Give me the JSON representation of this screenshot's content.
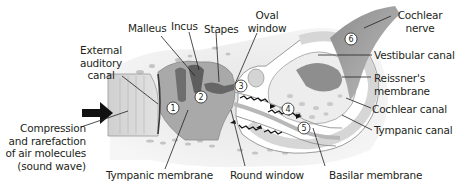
{
  "diagram": {
    "labels": {
      "malleus": "Malleus",
      "incus": "Incus",
      "stapes": "Stapes",
      "oval_window_1": "Oval",
      "oval_window_2": "window",
      "cochlear_nerve_1": "Cochlear",
      "cochlear_nerve_2": "nerve",
      "external_canal_1": "External",
      "external_canal_2": "auditory",
      "external_canal_3": "canal",
      "vestibular_canal": "Vestibular canal",
      "reissners_1": "Reissner's",
      "reissners_2": "membrane",
      "cochlear_canal": "Cochlear canal",
      "tympanic_canal": "Tympanic canal",
      "compression_1": "Compression",
      "compression_2": "and rarefaction",
      "compression_3": "of air molecules",
      "compression_4": "(sound wave)",
      "tympanic_membrane": "Tympanic membrane",
      "round_window": "Round window",
      "basilar_membrane": "Basilar membrane"
    },
    "steps": [
      "1",
      "2",
      "3",
      "4",
      "5",
      "6"
    ],
    "colors": {
      "text": "#231f20",
      "bone": "#d9d9d9",
      "tissue": "#a8a8a8",
      "dark": "#7a7a7a",
      "canal_fill": "#ffffff",
      "nerve": "#9a9a9a"
    }
  }
}
